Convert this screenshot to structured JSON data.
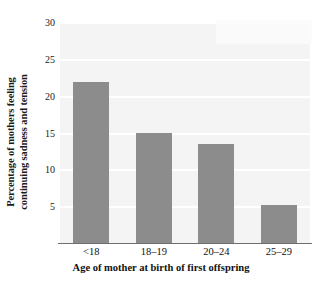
{
  "chart_data": {
    "type": "bar",
    "title": "",
    "subtitle": "",
    "xlabel": "Age of mother at birth of first offspring",
    "ylabel": "Percentage of mothers feeling continuing sadness and tension",
    "ylabel_line1": "Percentage of mothers feeling",
    "ylabel_line2": "continuing sadness and tension",
    "categories": [
      "<18",
      "18–19",
      "20–24",
      "25–29"
    ],
    "values": [
      21.8,
      15.0,
      13.5,
      5.2
    ],
    "ylim": [
      0,
      30
    ],
    "xlim_note": "categorical",
    "y_ticks": [
      5,
      10,
      15,
      20,
      25,
      30
    ],
    "y_tick_labels": [
      "5",
      "10",
      "15",
      "20",
      "25",
      "30"
    ],
    "grid": true,
    "grid_axis": "y",
    "legend": false,
    "legend_position": "none",
    "bar_color": "#8c8c8c",
    "plot_background": "#f4f4f4",
    "gridline_color": "#ffffff",
    "axis_line_color": "#6e6e6e",
    "text_color": "#111111"
  },
  "axes": {
    "y_title": "Percentage of mothers feeling continuing sadness and tension",
    "x_title": "Age of mother at birth of first offspring"
  }
}
